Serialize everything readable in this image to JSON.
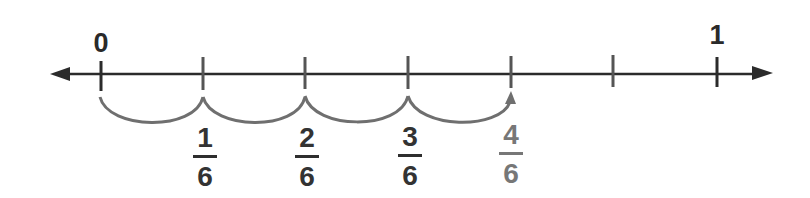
{
  "number_line": {
    "start_label": "0",
    "end_label": "1",
    "denominator": 6,
    "tick_count": 7,
    "axis_color": "#2b2b2b",
    "jump_color": "#6f6f6f"
  },
  "jumps": {
    "count": 4,
    "description": "Four jumps of 1/6 from 0 to 4/6"
  },
  "fractions": [
    {
      "numerator": "1",
      "denominator": "6",
      "color": "#2e2e2e"
    },
    {
      "numerator": "2",
      "denominator": "6",
      "color": "#2e2e2e"
    },
    {
      "numerator": "3",
      "denominator": "6",
      "color": "#2e2e2e"
    },
    {
      "numerator": "4",
      "denominator": "6",
      "color": "#777777"
    }
  ]
}
